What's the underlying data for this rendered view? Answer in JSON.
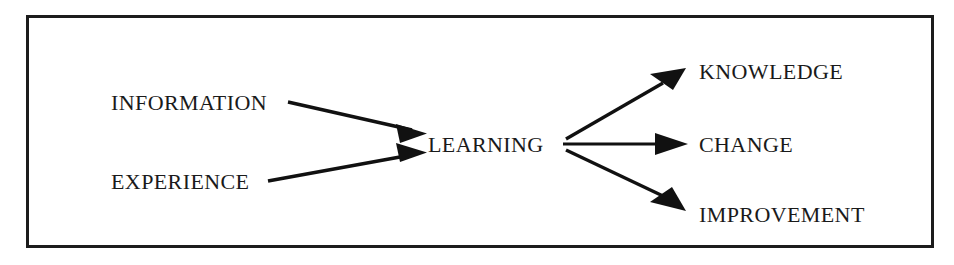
{
  "diagram": {
    "frame": {
      "x": 26,
      "y": 15,
      "width": 908,
      "height": 233,
      "border_color": "#1c1c1c",
      "border_width": 3,
      "background": "#ffffff"
    },
    "style": {
      "text_color": "#1a1a1a",
      "line_color": "#111111",
      "line_width": 3.2,
      "font_size": 22
    },
    "nodes": [
      {
        "id": "information",
        "label": "INFORMATION",
        "role": "input",
        "x": 111,
        "y": 110,
        "anchor": "start"
      },
      {
        "id": "experience",
        "label": "EXPERIENCE",
        "role": "input",
        "x": 111,
        "y": 189,
        "anchor": "start"
      },
      {
        "id": "learning",
        "label": "LEARNING",
        "role": "process",
        "x": 428,
        "y": 152,
        "anchor": "start"
      },
      {
        "id": "knowledge",
        "label": "KNOWLEDGE",
        "role": "output",
        "x": 699,
        "y": 79,
        "anchor": "start"
      },
      {
        "id": "change",
        "label": "CHANGE",
        "role": "output",
        "x": 699,
        "y": 152,
        "anchor": "start"
      },
      {
        "id": "improvement",
        "label": "IMPROVEMENT",
        "role": "output",
        "x": 699,
        "y": 222,
        "anchor": "start"
      }
    ],
    "edges": [
      {
        "id": "information-to-learning",
        "from": "information",
        "to": "learning",
        "x1": 288,
        "y1": 102,
        "x2": 422,
        "y2": 133
      },
      {
        "id": "experience-to-learning",
        "from": "experience",
        "to": "learning",
        "x1": 268,
        "y1": 181,
        "x2": 422,
        "y2": 153
      },
      {
        "id": "learning-to-knowledge",
        "from": "learning",
        "to": "knowledge",
        "x1": 566,
        "y1": 139,
        "x2": 682,
        "y2": 72
      },
      {
        "id": "learning-to-change",
        "from": "learning",
        "to": "change",
        "x1": 563,
        "y1": 144,
        "x2": 682,
        "y2": 144
      },
      {
        "id": "learning-to-improvement",
        "from": "learning",
        "to": "improvement",
        "x1": 566,
        "y1": 150,
        "x2": 682,
        "y2": 206
      }
    ]
  }
}
